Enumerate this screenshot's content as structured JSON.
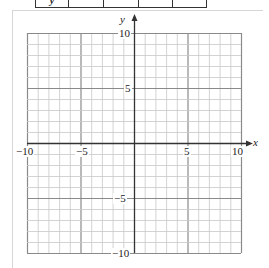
{
  "table": {
    "row_label": "y",
    "cells": [
      "",
      "",
      "",
      ""
    ]
  },
  "graph": {
    "x_axis_label": "x",
    "y_axis_label": "y",
    "xmin": -10,
    "xmax": 10,
    "ymin": -10,
    "ymax": 10,
    "grid_step": 1,
    "major_step": 5,
    "x_tick_labels": {
      "neg10": "−10",
      "neg5": "−5",
      "pos5": "5",
      "pos10": "10"
    },
    "y_tick_labels": {
      "pos10": "10",
      "pos5": "5",
      "neg5": "−5",
      "neg10": "−10"
    },
    "colors": {
      "minor_grid": "#c8c8c8",
      "major_grid": "#8a8a8a",
      "axis": "#333333"
    }
  }
}
